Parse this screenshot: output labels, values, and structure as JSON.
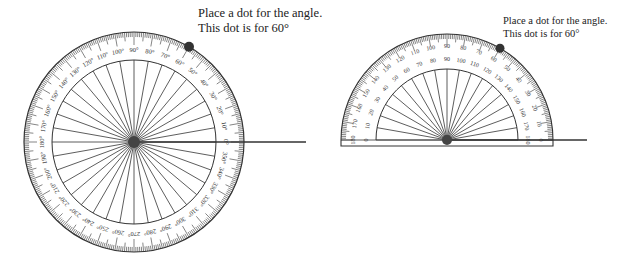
{
  "colors": {
    "ink": "#333333",
    "dot": "#333333",
    "background": "#ffffff"
  },
  "left_protractor": {
    "type": "full-circle",
    "center": [
      134,
      142
    ],
    "outer_radius": 110,
    "inner_radius": 82,
    "label_radius": 91,
    "spoke_step_deg": 10,
    "labels": [
      "0°",
      "10°",
      "20°",
      "30°",
      "40°",
      "50°",
      "60°",
      "70°",
      "80°",
      "90°",
      "100°",
      "110°",
      "120°",
      "130°",
      "140°",
      "150°",
      "160°",
      "170°",
      "180°",
      "190°",
      "200°",
      "210°",
      "220°",
      "230°",
      "240°",
      "250°",
      "260°",
      "270°",
      "280°",
      "290°",
      "300°",
      "310°",
      "320°",
      "330°",
      "340°",
      "350°"
    ],
    "ray_end_x": 306,
    "dot_angle_deg": 60,
    "caption": {
      "line1": "Place a dot for the angle.",
      "line2": "This dot is for 60°"
    }
  },
  "right_protractor": {
    "type": "semicircle",
    "center": [
      447,
      140
    ],
    "outer_radius": 106,
    "inner_radius": 71,
    "outer_label_radius": 93,
    "inner_label_radius": 80,
    "spoke_step_deg": 10,
    "outer_labels": [
      "180",
      "170",
      "160",
      "150",
      "140",
      "130",
      "120",
      "110",
      "100",
      "90",
      "80",
      "70",
      "60",
      "50",
      "40",
      "30",
      "20",
      "10",
      "0"
    ],
    "inner_labels": [
      "0",
      "10",
      "20",
      "30",
      "40",
      "50",
      "60",
      "70",
      "80",
      "90",
      "100",
      "110",
      "120",
      "130",
      "140",
      "150",
      "160",
      "170",
      "180"
    ],
    "ray_end_x": 587,
    "dot_angle_deg": 60,
    "caption": {
      "line1": "Place a dot for the angle.",
      "line2": "This dot is for 60°"
    }
  }
}
